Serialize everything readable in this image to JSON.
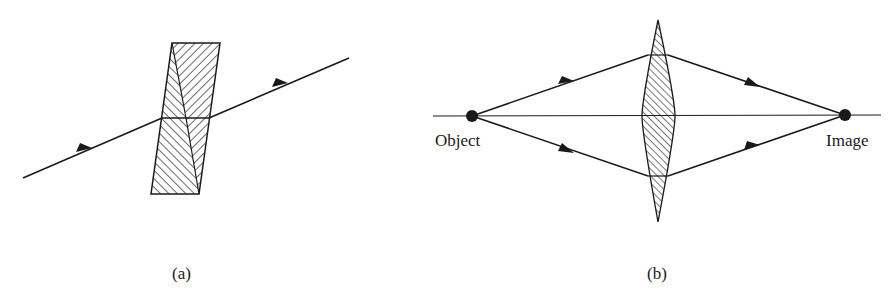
{
  "figure": {
    "panel_a": {
      "caption": "(a)",
      "description": "Light ray passing through two prisms stacked base-to-base",
      "ray": {
        "start": [
          23,
          178
        ],
        "end": [
          349,
          58
        ]
      },
      "arrows": [
        [
          85,
          151
        ],
        [
          281,
          86
        ]
      ],
      "prism_block": {
        "top_left": [
          172,
          43
        ],
        "top_right": [
          220,
          43
        ],
        "bottom_left": [
          151,
          194
        ],
        "bottom_right": [
          199,
          194
        ],
        "midline_y": 118
      }
    },
    "panel_b": {
      "caption": "(b)",
      "description": "Converging lens focusing rays from object to image",
      "axis": {
        "y": 116,
        "x_start": 433,
        "x_end": 881
      },
      "object": {
        "label": "Object",
        "point": [
          472,
          116
        ]
      },
      "image": {
        "label": "Image",
        "point": [
          845,
          115
        ]
      },
      "lens": {
        "top": [
          658,
          20
        ],
        "bottom": [
          658,
          222
        ],
        "left": [
          642,
          116
        ],
        "right": [
          675,
          116
        ],
        "upper_hit_y": 55,
        "lower_hit_y": 176
      },
      "arrows": [
        [
          566,
          84
        ],
        [
          566,
          150
        ],
        [
          752,
          84
        ],
        [
          752,
          148
        ]
      ]
    }
  },
  "colors": {
    "ink": "#1a1a1a",
    "background": "#ffffff"
  }
}
